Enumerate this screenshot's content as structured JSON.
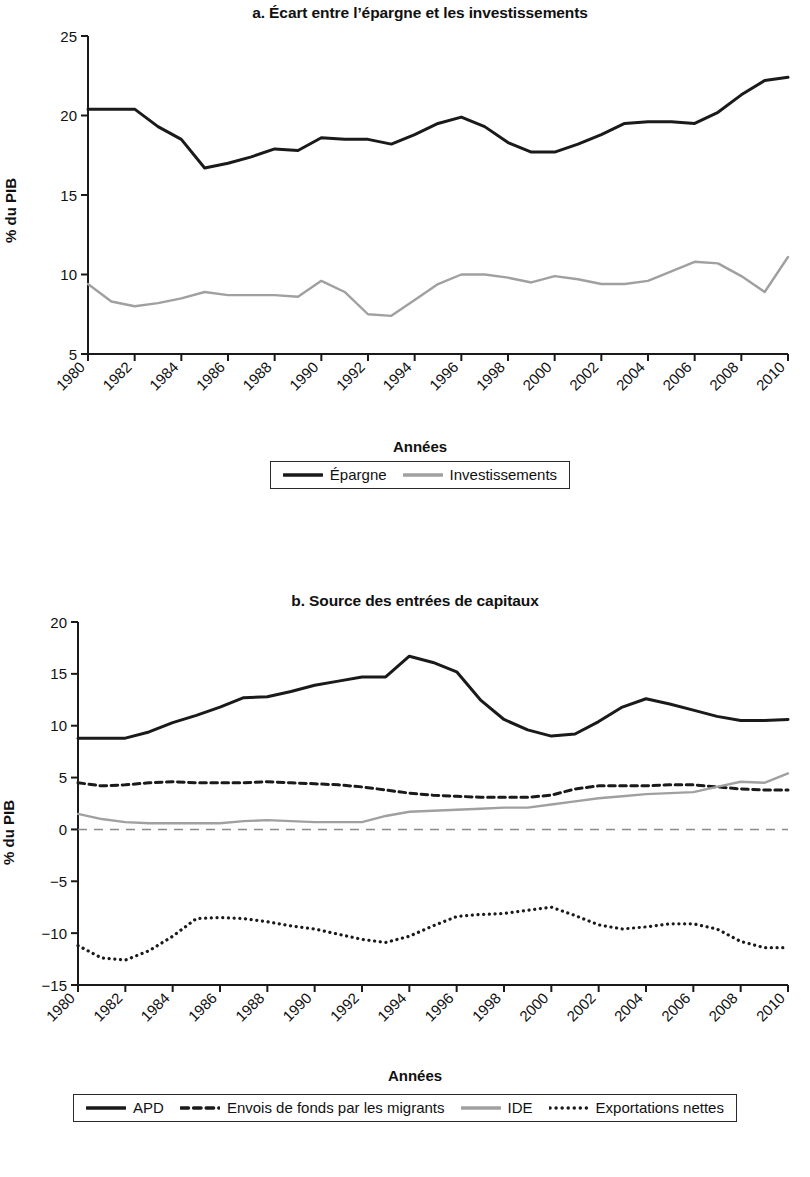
{
  "figure": {
    "y_axis_label": "% du PIB",
    "x_axis_label": "Années"
  },
  "panel_a": {
    "title": "a. Écart entre l’épargne et les investissements",
    "ylabel": "% du PIB",
    "xlabel": "Années",
    "legend": [
      {
        "label": "Épargne",
        "color": "#1a1a1a",
        "style": "solid"
      },
      {
        "label": "Investissements",
        "color": "#a0a0a0",
        "style": "solid"
      }
    ]
  },
  "panel_b": {
    "title": "b. Source des entrées de capitaux",
    "ylabel": "% du PIB",
    "xlabel": "Années",
    "legend": [
      {
        "label": "APD",
        "color": "#1a1a1a",
        "style": "solid"
      },
      {
        "label": "Envois de fonds par les migrants",
        "color": "#1a1a1a",
        "style": "dashed"
      },
      {
        "label": "IDE",
        "color": "#a0a0a0",
        "style": "solid"
      },
      {
        "label": "Exportations nettes",
        "color": "#1a1a1a",
        "style": "dotted"
      }
    ]
  },
  "chart_data": [
    {
      "type": "line",
      "id": "panel-a",
      "title": "a. Écart entre l’épargne et les investissements",
      "xlabel": "Années",
      "ylabel": "% du PIB",
      "xlim": [
        1980,
        2010
      ],
      "ylim": [
        5,
        25
      ],
      "yticks": [
        5,
        10,
        15,
        20,
        25
      ],
      "xticks": [
        1980,
        1982,
        1984,
        1986,
        1988,
        1990,
        1992,
        1994,
        1996,
        1998,
        2000,
        2002,
        2004,
        2006,
        2008,
        2010
      ],
      "grid": false,
      "legend_position": "bottom",
      "x": [
        1980,
        1981,
        1982,
        1983,
        1984,
        1985,
        1986,
        1987,
        1988,
        1989,
        1990,
        1991,
        1992,
        1993,
        1994,
        1995,
        1996,
        1997,
        1998,
        1999,
        2000,
        2001,
        2002,
        2003,
        2004,
        2005,
        2006,
        2007,
        2008,
        2009,
        2010
      ],
      "series": [
        {
          "name": "Épargne",
          "color": "#1a1a1a",
          "style": "solid",
          "values": [
            20.4,
            20.4,
            20.4,
            19.3,
            18.5,
            16.7,
            17.0,
            17.4,
            17.9,
            17.8,
            18.6,
            18.5,
            18.5,
            18.2,
            18.8,
            19.5,
            19.9,
            19.3,
            18.3,
            17.7,
            17.7,
            18.2,
            18.8,
            19.5,
            19.6,
            19.6,
            19.5,
            20.2,
            21.3,
            22.2,
            22.4
          ]
        },
        {
          "name": "Investissements",
          "color": "#a0a0a0",
          "style": "solid",
          "values": [
            9.4,
            8.3,
            8.0,
            8.2,
            8.5,
            8.9,
            8.7,
            8.7,
            8.7,
            8.6,
            9.6,
            8.9,
            7.5,
            7.4,
            8.4,
            9.4,
            10.0,
            10.0,
            9.8,
            9.5,
            9.9,
            9.7,
            9.4,
            9.4,
            9.6,
            10.2,
            10.8,
            10.7,
            9.9,
            8.9,
            11.1
          ]
        }
      ]
    },
    {
      "type": "line",
      "id": "panel-b",
      "title": "b. Source des entrées de capitaux",
      "xlabel": "Années",
      "ylabel": "% du PIB",
      "xlim": [
        1980,
        2010
      ],
      "ylim": [
        -15,
        20
      ],
      "yticks": [
        -15,
        -10,
        -5,
        0,
        5,
        10,
        15,
        20
      ],
      "xticks": [
        1980,
        1982,
        1984,
        1986,
        1988,
        1990,
        1992,
        1994,
        1996,
        1998,
        2000,
        2002,
        2004,
        2006,
        2008,
        2010
      ],
      "grid": false,
      "zero_line": true,
      "legend_position": "bottom",
      "x": [
        1980,
        1981,
        1982,
        1983,
        1984,
        1985,
        1986,
        1987,
        1988,
        1989,
        1990,
        1991,
        1992,
        1993,
        1994,
        1995,
        1996,
        1997,
        1998,
        1999,
        2000,
        2001,
        2002,
        2003,
        2004,
        2005,
        2006,
        2007,
        2008,
        2009,
        2010
      ],
      "series": [
        {
          "name": "APD",
          "color": "#1a1a1a",
          "style": "solid",
          "values": [
            8.8,
            8.8,
            8.8,
            9.4,
            10.3,
            11.0,
            11.8,
            12.7,
            12.8,
            13.3,
            13.9,
            14.3,
            14.7,
            14.7,
            16.7,
            16.1,
            15.2,
            12.5,
            10.6,
            9.6,
            9.0,
            9.2,
            10.4,
            11.8,
            12.6,
            12.1,
            11.5,
            10.9,
            10.5,
            10.5,
            10.6
          ]
        },
        {
          "name": "Envois de fonds par les migrants",
          "color": "#1a1a1a",
          "style": "dashed",
          "values": [
            4.5,
            4.2,
            4.3,
            4.5,
            4.6,
            4.5,
            4.5,
            4.5,
            4.6,
            4.5,
            4.4,
            4.3,
            4.1,
            3.8,
            3.5,
            3.3,
            3.2,
            3.1,
            3.1,
            3.1,
            3.3,
            3.9,
            4.2,
            4.2,
            4.2,
            4.3,
            4.3,
            4.1,
            3.9,
            3.8,
            3.8
          ]
        },
        {
          "name": "IDE",
          "color": "#a0a0a0",
          "style": "solid",
          "values": [
            1.5,
            1.0,
            0.7,
            0.6,
            0.6,
            0.6,
            0.6,
            0.8,
            0.9,
            0.8,
            0.7,
            0.7,
            0.7,
            1.3,
            1.7,
            1.8,
            1.9,
            2.0,
            2.1,
            2.1,
            2.4,
            2.7,
            3.0,
            3.2,
            3.4,
            3.5,
            3.6,
            4.1,
            4.6,
            4.5,
            5.4
          ]
        },
        {
          "name": "Exportations nettes",
          "color": "#1a1a1a",
          "style": "dotted",
          "values": [
            -11.2,
            -12.4,
            -12.6,
            -11.7,
            -10.3,
            -8.6,
            -8.5,
            -8.6,
            -8.9,
            -9.3,
            -9.6,
            -10.1,
            -10.6,
            -10.9,
            -10.3,
            -9.3,
            -8.4,
            -8.2,
            -8.1,
            -7.8,
            -7.5,
            -8.3,
            -9.2,
            -9.6,
            -9.4,
            -9.1,
            -9.1,
            -9.6,
            -10.8,
            -11.4,
            -11.4
          ]
        }
      ]
    }
  ]
}
